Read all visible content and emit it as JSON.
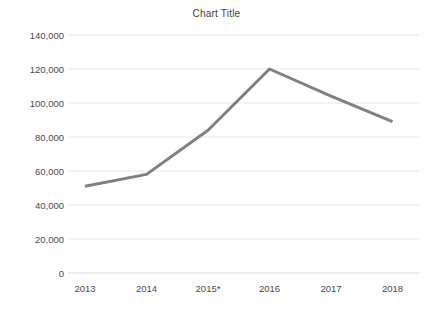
{
  "chart_data": {
    "type": "line",
    "title": "Chart Title",
    "xlabel": "",
    "ylabel": "",
    "categories": [
      "2013",
      "2014",
      "2015*",
      "2016",
      "2017",
      "2018"
    ],
    "series": [
      {
        "name": "Series 1",
        "values": [
          51000,
          58000,
          84000,
          120000,
          104000,
          89000
        ],
        "color": "#808080"
      }
    ],
    "ylim": [
      0,
      140000
    ],
    "y_ticks": [
      0,
      20000,
      40000,
      60000,
      80000,
      100000,
      120000,
      140000
    ],
    "y_tick_labels": [
      "0",
      "20,000",
      "40,000",
      "60,000",
      "80,000",
      "100,000",
      "120,000",
      "140,000"
    ],
    "grid": true,
    "grid_color": "#e8e8e8",
    "legend": false,
    "legend_position": "none",
    "background": "#ffffff",
    "line_width": 3
  }
}
